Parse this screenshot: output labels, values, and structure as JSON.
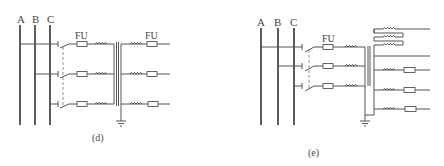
{
  "panels": [
    {
      "id": "d",
      "caption": "(d)",
      "phase_labels": [
        "A",
        "B",
        "C"
      ],
      "fuse_label_primary": "FU",
      "fuse_label_secondary": "FU",
      "components": [
        "three-phase-bus",
        "isolating-switch",
        "fuse",
        "primary-winding",
        "transformer-core",
        "secondary-winding",
        "fuse",
        "ground"
      ]
    },
    {
      "id": "e",
      "caption": "(e)",
      "phase_labels": [
        "A",
        "B",
        "C"
      ],
      "fuse_label_primary": "FU",
      "components": [
        "three-phase-bus",
        "isolating-switch",
        "fuse",
        "primary-winding",
        "transformer-core",
        "secondary-windings",
        "open-delta-windings",
        "fuse",
        "ground"
      ]
    }
  ],
  "colors": {
    "line": "#555555",
    "bus": "#333333",
    "text": "#444444",
    "background": "#ffffff"
  }
}
